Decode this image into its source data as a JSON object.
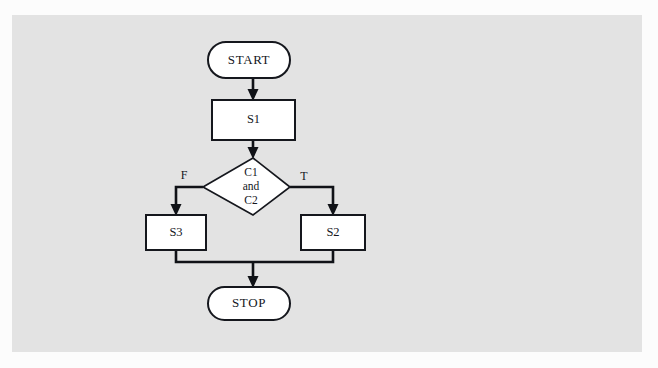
{
  "diagram": {
    "type": "flowchart",
    "title": "",
    "background_color": "#e3e3e3",
    "page_color": "#fcfcfc",
    "node_fill": "#ffffff",
    "line_color": "#101217",
    "nodes": [
      {
        "id": "start",
        "label": "START",
        "shape": "terminator"
      },
      {
        "id": "s1",
        "label": "S1",
        "shape": "process"
      },
      {
        "id": "decision",
        "label": "C1\nand\nC2",
        "shape": "decision",
        "line1": "C1",
        "line2": "and",
        "line3": "C2"
      },
      {
        "id": "s3",
        "label": "S3",
        "shape": "process"
      },
      {
        "id": "s2",
        "label": "S2",
        "shape": "process"
      },
      {
        "id": "stop",
        "label": "STOP",
        "shape": "terminator"
      }
    ],
    "edges": [
      {
        "from": "start",
        "to": "s1",
        "label": ""
      },
      {
        "from": "s1",
        "to": "decision",
        "label": ""
      },
      {
        "from": "decision",
        "to": "s3",
        "label": "F"
      },
      {
        "from": "decision",
        "to": "s2",
        "label": "T"
      },
      {
        "from": "s3",
        "to": "stop",
        "label": ""
      },
      {
        "from": "s2",
        "to": "stop",
        "label": ""
      }
    ],
    "branch_labels": {
      "false": "F",
      "true": "T"
    }
  }
}
